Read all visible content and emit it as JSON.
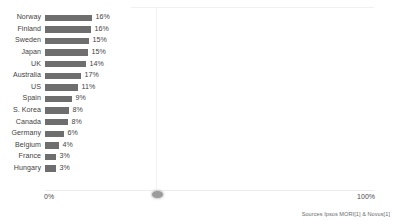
{
  "chart_data": {
    "type": "bar",
    "orientation": "horizontal",
    "title": "",
    "xlabel": "",
    "ylabel": "",
    "xlim": [
      0,
      100
    ],
    "grid": true,
    "legend": false,
    "legend_position": "none",
    "bar_color": "#6e6e6e",
    "axis_ticks": [
      "0%",
      "100%"
    ],
    "value_suffix": "%",
    "categories": [
      "Norway",
      "Finland",
      "Sweden",
      "Japan",
      "UK",
      "Australia",
      "US",
      "Spain",
      "S. Korea",
      "Canada",
      "Germany",
      "Belgium",
      "France",
      "Hungary"
    ],
    "values": [
      16,
      16,
      15,
      15,
      14,
      12,
      11,
      9,
      8,
      8,
      6,
      4,
      3,
      3
    ],
    "value_labels": [
      "16%",
      "16%",
      "15%",
      "15%",
      "14%",
      "17%",
      "11%",
      "9%",
      "8%",
      "8%",
      "6%",
      "4%",
      "3%",
      "3%"
    ],
    "rows": [
      {
        "label": "Norway",
        "value": 16,
        "value_label": "16%",
        "bar_px": 47
      },
      {
        "label": "Finland",
        "value": 16,
        "value_label": "16%",
        "bar_px": 46
      },
      {
        "label": "Sweden",
        "value": 15,
        "value_label": "15%",
        "bar_px": 44
      },
      {
        "label": "Japan",
        "value": 15,
        "value_label": "15%",
        "bar_px": 43
      },
      {
        "label": "UK",
        "value": 14,
        "value_label": "14%",
        "bar_px": 41
      },
      {
        "label": "Australia",
        "value": 12,
        "value_label": "17%",
        "bar_px": 36
      },
      {
        "label": "US",
        "value": 11,
        "value_label": "11%",
        "bar_px": 33
      },
      {
        "label": "Spain",
        "value": 9,
        "value_label": "9%",
        "bar_px": 27
      },
      {
        "label": "S. Korea",
        "value": 8,
        "value_label": "8%",
        "bar_px": 24
      },
      {
        "label": "Canada",
        "value": 8,
        "value_label": "8%",
        "bar_px": 23
      },
      {
        "label": "Germany",
        "value": 6,
        "value_label": "6%",
        "bar_px": 19
      },
      {
        "label": "Belgium",
        "value": 4,
        "value_label": "4%",
        "bar_px": 14
      },
      {
        "label": "France",
        "value": 3,
        "value_label": "3%",
        "bar_px": 11
      },
      {
        "label": "Hungary",
        "value": 3,
        "value_label": "3%",
        "bar_px": 11
      }
    ]
  },
  "axis": {
    "left_label": "0%",
    "right_label": "100%"
  },
  "footer": {
    "source": "Sources Ipsos MORI[1] & Novus[1]"
  }
}
